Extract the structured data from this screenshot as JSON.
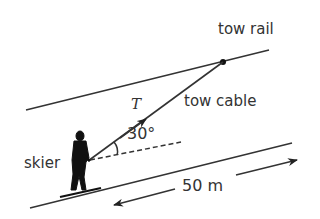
{
  "diagram": {
    "labels": {
      "tow_rail": "tow rail",
      "tow_cable": "tow cable",
      "tension": "T",
      "angle": "30°",
      "skier": "skier",
      "distance": "50 m"
    },
    "values": {
      "angle_deg": 30,
      "distance_m": 50
    },
    "colors": {
      "line": "#333333",
      "text": "#333333",
      "background": "#ffffff"
    }
  }
}
